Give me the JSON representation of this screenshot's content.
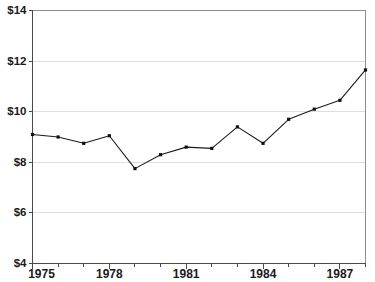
{
  "chart_data": {
    "type": "line",
    "title": "",
    "subtitle": "",
    "xlabel": "",
    "ylabel": "",
    "x": [
      1975,
      1976,
      1977,
      1978,
      1979,
      1980,
      1981,
      1982,
      1983,
      1984,
      1985,
      1986,
      1987,
      1988
    ],
    "values": [
      9.1,
      9.0,
      8.75,
      9.05,
      7.75,
      8.3,
      8.6,
      8.55,
      9.4,
      8.75,
      9.7,
      10.1,
      10.45,
      11.65
    ],
    "series": [
      {
        "name": "",
        "values": [
          9.1,
          9.0,
          8.75,
          9.05,
          7.75,
          8.3,
          8.6,
          8.55,
          9.4,
          8.75,
          9.7,
          10.1,
          10.45,
          11.65
        ]
      }
    ],
    "xlim": [
      1975,
      1988
    ],
    "ylim": [
      4,
      14
    ],
    "y_tick_values": [
      4,
      6,
      8,
      10,
      12,
      14
    ],
    "y_tick_labels": [
      "$4",
      "$6",
      "$8",
      "$10",
      "$12",
      "$14"
    ],
    "x_tick_values": [
      1975,
      1976,
      1977,
      1978,
      1979,
      1980,
      1981,
      1982,
      1983,
      1984,
      1985,
      1986,
      1987,
      1988
    ],
    "x_tick_labels_shown": [
      "1975",
      "1978",
      "1981",
      "1984",
      "1987"
    ],
    "x_tick_label_values": [
      1975,
      1978,
      1981,
      1984,
      1987
    ],
    "grid": true,
    "grid_axis": "y",
    "legend": null,
    "legend_position": "none",
    "marker": "square",
    "colors": {
      "line": "#1a1a1a",
      "marker": "#111111",
      "gridline": "#dedede",
      "axis": "#4a4a4a",
      "plot_border": "#8c8c8c",
      "background": "#ffffff",
      "text": "#1a1a1a"
    },
    "annotations": []
  },
  "axes": {
    "y_labels": [
      {
        "text": "$14",
        "value": 14
      },
      {
        "text": "$12",
        "value": 12
      },
      {
        "text": "$10",
        "value": 10
      },
      {
        "text": "$8",
        "value": 8
      },
      {
        "text": "$6",
        "value": 6
      },
      {
        "text": "$4",
        "value": 4
      }
    ],
    "x_labels": [
      {
        "text": "1975",
        "value": 1975
      },
      {
        "text": "1978",
        "value": 1978
      },
      {
        "text": "1981",
        "value": 1981
      },
      {
        "text": "1984",
        "value": 1984
      },
      {
        "text": "1987",
        "value": 1987
      }
    ]
  }
}
